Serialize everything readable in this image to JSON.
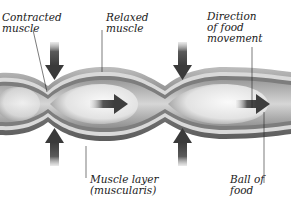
{
  "diagram": {
    "labels": {
      "contracted_muscle": "Contracted\nmuscle",
      "relaxed_muscle": "Relaxed\nmuscle",
      "direction_of_food": "Direction\nof food\nmovement",
      "muscle_layer": "Muscle layer\n(muscularis)",
      "ball_of_food": "Ball of\nfood"
    },
    "colors": {
      "outer_wall": "#8a8a8a",
      "muscle_band": "#6f6f6f",
      "inner_lining": "#d8d8d8",
      "lumen": "#bdbdbd",
      "food_ball": "#eeeeee",
      "arrow": "#4a4a4a",
      "leader_line": "#222222"
    },
    "arrows": {
      "squeeze_down": 2,
      "squeeze_up": 2,
      "food_direction": 2
    }
  }
}
